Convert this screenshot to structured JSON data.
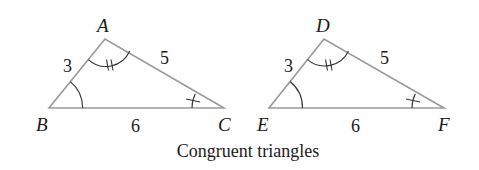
{
  "caption": "Congruent triangles",
  "colors": {
    "edge": "#9a9a9a",
    "marks": "#333333",
    "text": "#1a1a1a"
  },
  "triangles": [
    {
      "vertices": {
        "top": "A",
        "left": "B",
        "right": "C"
      },
      "sides": {
        "left": "3",
        "right": "5",
        "base": "6"
      }
    },
    {
      "vertices": {
        "top": "D",
        "left": "E",
        "right": "F"
      },
      "sides": {
        "left": "3",
        "right": "5",
        "base": "6"
      }
    }
  ]
}
